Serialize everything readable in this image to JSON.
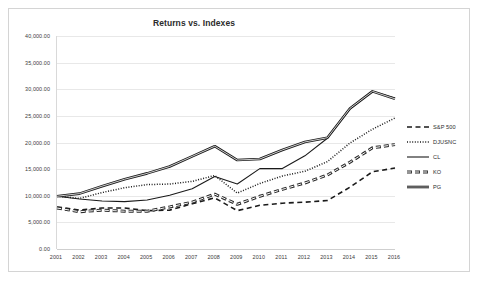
{
  "chart_data": {
    "type": "line",
    "title": "Returns vs. Indexes",
    "xlabel": "",
    "ylabel": "",
    "grid": true,
    "legend_position": "right",
    "ylim": [
      0,
      40000
    ],
    "ytick_step": 5000,
    "ytick_labels": [
      "40,000.00",
      "35,000.00",
      "30,000.00",
      "25,000.00",
      "20,000.00",
      "15,000.00",
      "10,000.00",
      "5,000.00",
      "0.00"
    ],
    "ytick_values": [
      40000,
      35000,
      30000,
      25000,
      20000,
      15000,
      10000,
      5000,
      0
    ],
    "categories": [
      "2001",
      "2002",
      "2003",
      "2004",
      "2005",
      "2006",
      "2007",
      "2008",
      "2009",
      "2010",
      "2011",
      "2012",
      "2013",
      "2014",
      "2015",
      "2016"
    ],
    "series": [
      {
        "name": "S&P 500",
        "style": "dashed",
        "width": 1.6,
        "color": "#1a1a1a",
        "values": [
          7900,
          7300,
          7700,
          7700,
          7200,
          7300,
          8500,
          9600,
          7200,
          8200,
          8600,
          8800,
          9100,
          11600,
          14500,
          15200
        ]
      },
      {
        "name": "DJUSNC",
        "style": "dotted",
        "width": 1.5,
        "color": "#1a1a1a",
        "values": [
          9900,
          9500,
          10600,
          11500,
          12100,
          12200,
          12700,
          13800,
          10500,
          12300,
          13700,
          14600,
          16400,
          19900,
          22500,
          24600
        ]
      },
      {
        "name": "CL",
        "style": "solid",
        "width": 1.1,
        "color": "#1a1a1a",
        "values": [
          9900,
          9400,
          9000,
          8900,
          9200,
          10100,
          11300,
          13600,
          12200,
          15100,
          15100,
          17500,
          20800,
          26300,
          29600,
          28300
        ]
      },
      {
        "name": "KO",
        "style": "thick-dashed",
        "width": 3.0,
        "color": "#2b2b2b",
        "values": [
          7700,
          7000,
          7300,
          7100,
          7100,
          7900,
          8800,
          10300,
          8400,
          9900,
          11200,
          12400,
          13900,
          16300,
          19000,
          19600
        ]
      },
      {
        "name": "PG",
        "style": "thick-solid",
        "width": 2.6,
        "color": "#1a1a1a",
        "values": [
          9900,
          10400,
          11800,
          13100,
          14200,
          15500,
          17400,
          19300,
          16700,
          16900,
          18600,
          20100,
          20900,
          26400,
          29600,
          28200
        ]
      }
    ]
  },
  "legend": {
    "entries": [
      {
        "label": "S&P 500"
      },
      {
        "label": "DJUSNC"
      },
      {
        "label": "CL"
      },
      {
        "label": "KO"
      },
      {
        "label": "PG"
      }
    ]
  }
}
